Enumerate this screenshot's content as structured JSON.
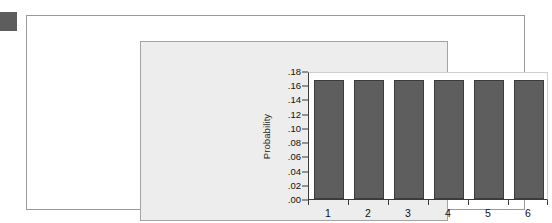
{
  "figure": {
    "marker_icon": "page-marker-square",
    "marker_color": "#5d5d5d",
    "card_background": "#ffffff",
    "panel_background": "#ededed",
    "plot_background": "#ffffff",
    "bar_fill": "#5e5e5e",
    "bar_border": "#3c3c3c",
    "axis_color": "#3b3b3b"
  },
  "chart_data": {
    "type": "bar",
    "title": "",
    "xlabel": "Number of Dots Showing on the Die",
    "ylabel": "Probability",
    "categories": [
      "1",
      "2",
      "3",
      "4",
      "5",
      "6"
    ],
    "values": [
      0.167,
      0.167,
      0.167,
      0.167,
      0.167,
      0.167
    ],
    "ylim": [
      0.0,
      0.18
    ],
    "ytick_values": [
      0.0,
      0.02,
      0.04,
      0.06,
      0.08,
      0.1,
      0.12,
      0.14,
      0.16,
      0.18
    ],
    "ytick_labels": [
      ".00",
      ".02",
      ".04",
      ".06",
      ".08",
      ".10",
      ".12",
      ".14",
      ".16",
      ".18"
    ],
    "grid": false,
    "legend": false,
    "legend_position": "none"
  }
}
